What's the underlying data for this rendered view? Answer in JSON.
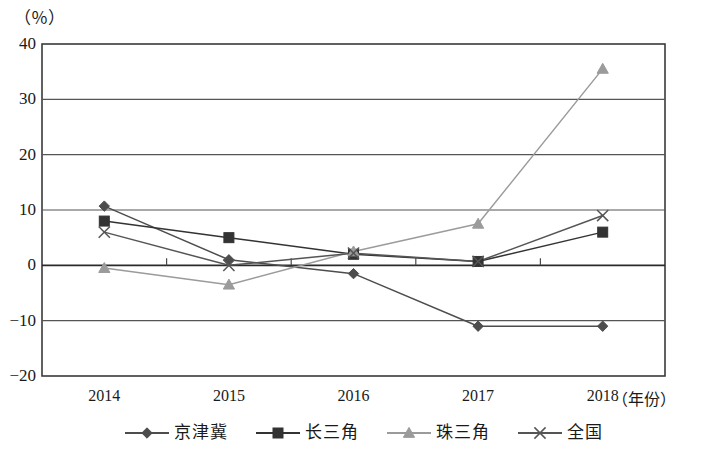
{
  "chart_data": {
    "type": "line",
    "title": "",
    "xlabel": "（年份）",
    "ylabel": "（％）",
    "categories": [
      "2014",
      "2015",
      "2016",
      "2017",
      "2018"
    ],
    "ylim": [
      -20,
      40
    ],
    "yticks": [
      "40",
      "30",
      "20",
      "10",
      "0",
      "-10",
      "-20"
    ],
    "ytick_values": [
      40,
      30,
      20,
      10,
      0,
      -10,
      -20
    ],
    "grid": true,
    "legend_position": "bottom",
    "series": [
      {
        "name": "京津冀",
        "marker": "diamond",
        "color": "#4d4d4d",
        "values": [
          10.7,
          1.0,
          -1.5,
          -11.0,
          -11.0
        ]
      },
      {
        "name": "长三角",
        "marker": "square",
        "color": "#333333",
        "values": [
          8.0,
          5.0,
          2.0,
          0.7,
          6.0
        ]
      },
      {
        "name": "珠三角",
        "marker": "triangle",
        "color": "#9b9b9b",
        "values": [
          -0.5,
          -3.5,
          2.5,
          7.5,
          35.5
        ]
      },
      {
        "name": "全国",
        "marker": "cross",
        "color": "#555555",
        "values": [
          6.0,
          0.0,
          2.2,
          0.7,
          9.0
        ]
      }
    ]
  },
  "axes": {
    "y_unit": "（％）",
    "x_unit": "（年份）"
  },
  "legend": {
    "items": [
      {
        "label": "京津冀",
        "marker": "diamond-marker-icon"
      },
      {
        "label": "长三角",
        "marker": "square-marker-icon"
      },
      {
        "label": "珠三角",
        "marker": "triangle-marker-icon"
      },
      {
        "label": "全国",
        "marker": "cross-marker-icon"
      }
    ]
  }
}
